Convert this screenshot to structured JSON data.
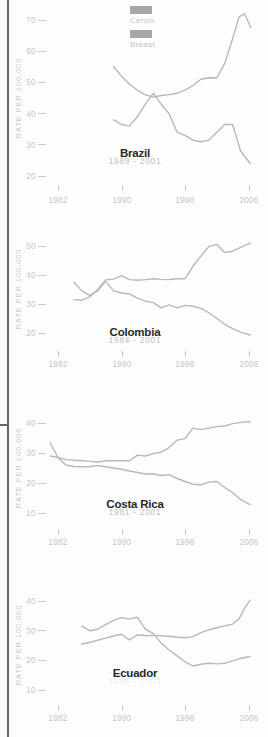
{
  "palette": {
    "background": "#fdfdfd",
    "left_border": "#666666",
    "line_stroke": "#b8b8b8",
    "tick_text": "#c5c5c5",
    "tick_line": "#c9c9c9",
    "y_axis_label": "#c9c9c9",
    "country_title": "#282828",
    "period_text": "#c0c0c0",
    "period_text_faint": "#eeeeee",
    "legend_swatch": "#a6a6a6",
    "legend_text": "#c4c4c4"
  },
  "legend": {
    "items": [
      {
        "label": "Cervix"
      },
      {
        "label": "Breast"
      }
    ]
  },
  "chart_data": [
    {
      "type": "line",
      "title": "Brazil",
      "period": "1989 - 2001",
      "ylabel": "RATE PER 100,000",
      "yticks": [
        70,
        60,
        50,
        40,
        30,
        20
      ],
      "xticks": [
        1982,
        1990,
        1998,
        2006
      ],
      "ylim": [
        20,
        70
      ],
      "xlim": [
        1976,
        2008
      ],
      "grid": false,
      "legend_position": "top-center",
      "series": [
        {
          "name": "Cervix",
          "x": [
            1989,
            1990,
            1991,
            1992,
            1993,
            1994,
            1995,
            1996,
            1997,
            1998,
            1999,
            2000,
            2001,
            2002,
            2003,
            2004,
            2005,
            2006.2
          ],
          "y": [
            38,
            36.5,
            36,
            39,
            43,
            46.5,
            43,
            40,
            34,
            33,
            31.5,
            31,
            31.5,
            34,
            36.5,
            36.5,
            28,
            24
          ]
        },
        {
          "name": "Breast",
          "x": [
            1989,
            1990,
            1991,
            1992,
            1993,
            1994,
            1995,
            1996,
            1997,
            1998,
            1999,
            2000,
            2001,
            2002,
            2003,
            2004,
            2004.8,
            2005.5,
            2006.3
          ],
          "y": [
            55,
            52,
            49.5,
            47.5,
            46,
            45.3,
            45.8,
            46.1,
            46.5,
            47.5,
            49,
            51,
            51.5,
            51.4,
            56,
            64,
            71,
            72,
            67.5
          ]
        }
      ]
    },
    {
      "type": "line",
      "title": "Colombia",
      "period": "1984 - 2001",
      "ylabel": "RATE PER 100,000",
      "yticks": [
        50,
        40,
        30,
        20
      ],
      "xticks": [
        1982,
        1990,
        1998,
        2006
      ],
      "ylim": [
        20,
        50
      ],
      "xlim": [
        1976,
        2008
      ],
      "grid": false,
      "series": [
        {
          "name": "Cervix",
          "x": [
            1984,
            1985,
            1986,
            1987,
            1988,
            1989,
            1990,
            1991,
            1992,
            1993,
            1994,
            1995,
            1996,
            1997,
            1998,
            1999,
            2000,
            2001,
            2002,
            2003,
            2004,
            2005,
            2006.2
          ],
          "y": [
            37.5,
            34.5,
            33,
            34.5,
            37.8,
            34.5,
            33.8,
            33.5,
            32,
            31,
            30.5,
            28.7,
            29.7,
            28.7,
            29.5,
            29.2,
            28.5,
            27,
            25,
            23,
            21.5,
            20.3,
            19.3
          ]
        },
        {
          "name": "Breast",
          "x": [
            1984,
            1985,
            1986,
            1987,
            1988,
            1989,
            1990,
            1991,
            1992,
            1993,
            1994,
            1995,
            1996,
            1997,
            1998,
            1999,
            2000,
            2001,
            2002,
            2003,
            2004,
            2005,
            2006.2
          ],
          "y": [
            31.5,
            31.3,
            32.5,
            35,
            38.3,
            38.6,
            39.8,
            38.4,
            38.2,
            38.4,
            38.7,
            38.5,
            38.4,
            38.7,
            38.7,
            43,
            46.5,
            49.8,
            50.6,
            47.8,
            48.2,
            49.5,
            51
          ]
        }
      ]
    },
    {
      "type": "line",
      "title": "Costa Rica",
      "period": "1981 - 2001",
      "ylabel": "RATE PER 100,000",
      "yticks": [
        40,
        30,
        20,
        10
      ],
      "xticks": [
        1982,
        1990,
        1998,
        2006
      ],
      "ylim": [
        10,
        40
      ],
      "xlim": [
        1976,
        2008
      ],
      "grid": false,
      "series": [
        {
          "name": "Cervix",
          "x": [
            1981,
            1982,
            1983,
            1984,
            1985,
            1986,
            1987,
            1988,
            1989,
            1990,
            1991,
            1992,
            1993,
            1994,
            1995,
            1996,
            1997,
            1998,
            1999,
            2000,
            2001,
            2002,
            2003,
            2004,
            2005,
            2006.2
          ],
          "y": [
            33.5,
            28.5,
            26,
            25.5,
            25.4,
            25.5,
            25.8,
            25.4,
            25,
            24.6,
            24,
            23.5,
            23,
            23.1,
            22.5,
            22.8,
            21.5,
            20.5,
            19.6,
            19.4,
            20.3,
            20.5,
            18.5,
            16.8,
            14.5,
            12.8
          ]
        },
        {
          "name": "Breast",
          "x": [
            1981,
            1982,
            1983,
            1984,
            1985,
            1986,
            1987,
            1988,
            1989,
            1990,
            1991,
            1992,
            1993,
            1994,
            1995,
            1996,
            1997,
            1998,
            1999,
            2000,
            2001,
            2002,
            2003,
            2004,
            2005,
            2006.2
          ],
          "y": [
            29,
            28.5,
            27.8,
            27.6,
            27.4,
            27.2,
            27,
            27.4,
            27.4,
            27.4,
            27.4,
            29.3,
            29,
            29.8,
            30.3,
            31.8,
            34.3,
            34.8,
            38.3,
            37.8,
            38.3,
            38.8,
            39,
            39.8,
            40.2,
            40.4
          ]
        }
      ]
    },
    {
      "type": "line",
      "title": "Ecuador",
      "period": "1985 - 2003",
      "period_faint": true,
      "ylabel": "RATE PER 100,000",
      "yticks": [
        40,
        30,
        20,
        10
      ],
      "xticks": [
        1982,
        1990,
        1998,
        2006
      ],
      "ylim": [
        10,
        40
      ],
      "xlim": [
        1976,
        2008
      ],
      "grid": false,
      "series": [
        {
          "name": "Cervix",
          "x": [
            1985,
            1986,
            1987,
            1988,
            1989,
            1990,
            1991,
            1992,
            1993,
            1994,
            1995,
            1996,
            1997,
            1998,
            1999,
            2000,
            2001,
            2002,
            2003,
            2004,
            2005,
            2006.2
          ],
          "y": [
            31.5,
            30,
            30.5,
            32,
            33.5,
            34.4,
            33.9,
            34.5,
            30.5,
            29,
            25.8,
            23.5,
            21.5,
            19.5,
            18.1,
            18.7,
            19,
            18.8,
            19,
            19.8,
            20.7,
            21.3
          ]
        },
        {
          "name": "Breast",
          "x": [
            1985,
            1986,
            1987,
            1988,
            1989,
            1990,
            1991,
            1992,
            1993,
            1994,
            1995,
            1996,
            1997,
            1998,
            1999,
            2000,
            2001,
            2002,
            2003,
            2004,
            2004.8,
            2005.5,
            2006.2
          ],
          "y": [
            25.5,
            26,
            26.8,
            27.5,
            28.2,
            28.8,
            26.9,
            28.6,
            28.3,
            28.4,
            28.3,
            28.1,
            27.8,
            27.6,
            28,
            29.3,
            30.3,
            31,
            31.6,
            32.2,
            34,
            37.5,
            40.3
          ]
        }
      ]
    }
  ]
}
